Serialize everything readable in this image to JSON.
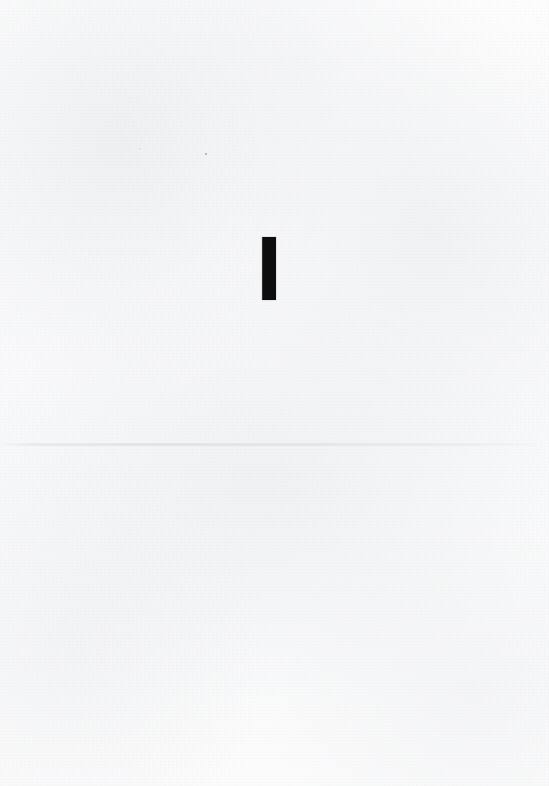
{
  "page": {
    "width": 549,
    "height": 786,
    "background_color": "#fbfbfb",
    "text_content": ""
  },
  "mark": {
    "glyph": "",
    "semantic": "vertical-stroke",
    "color": "#0d0d0d",
    "x": 262,
    "y": 237,
    "width": 14,
    "height": 63
  },
  "crease": {
    "y": 443,
    "color": "#dde0e4"
  },
  "specks": [
    {
      "x": 205,
      "y": 153,
      "size": 2,
      "color": "#aaa8ac"
    },
    {
      "x": 139,
      "y": 148,
      "size": 1,
      "color": "#b4b2b6"
    }
  ]
}
